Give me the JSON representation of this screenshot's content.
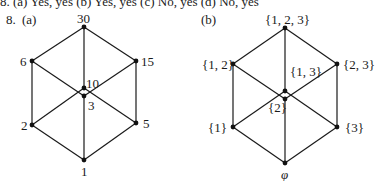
{
  "top_line": "8. (a)  Yes, yes    (b)  Yes, yes    (c)  No, yes    (d)  No, yes",
  "problem_number": "8.",
  "diagrams": [
    {
      "label": "(a)",
      "title": "Hasse diagram of divisors of 30",
      "nodes": [
        {
          "id": "30",
          "text": "30"
        },
        {
          "id": "6",
          "text": "6"
        },
        {
          "id": "15",
          "text": "15"
        },
        {
          "id": "10",
          "text": "10"
        },
        {
          "id": "3",
          "text": "3"
        },
        {
          "id": "2",
          "text": "2"
        },
        {
          "id": "5",
          "text": "5"
        },
        {
          "id": "1",
          "text": "1"
        }
      ],
      "edges": [
        [
          "30",
          "6"
        ],
        [
          "30",
          "15"
        ],
        [
          "30",
          "10"
        ],
        [
          "6",
          "2"
        ],
        [
          "6",
          "3"
        ],
        [
          "15",
          "3"
        ],
        [
          "15",
          "5"
        ],
        [
          "10",
          "2"
        ],
        [
          "10",
          "5"
        ],
        [
          "2",
          "1"
        ],
        [
          "3",
          "1"
        ],
        [
          "5",
          "1"
        ]
      ]
    },
    {
      "label": "(b)",
      "title": "Hasse diagram of power set of {1, 2, 3}",
      "nodes": [
        {
          "id": "123",
          "text": "{1, 2, 3}"
        },
        {
          "id": "12",
          "text": "{1, 2}"
        },
        {
          "id": "23",
          "text": "{2, 3}"
        },
        {
          "id": "13",
          "text": "{1, 3}"
        },
        {
          "id": "2",
          "text": "{2}"
        },
        {
          "id": "1",
          "text": "{1}"
        },
        {
          "id": "3",
          "text": "{3}"
        },
        {
          "id": "empty",
          "text": "φ"
        }
      ],
      "edges": [
        [
          "123",
          "12"
        ],
        [
          "123",
          "23"
        ],
        [
          "123",
          "13"
        ],
        [
          "12",
          "1"
        ],
        [
          "12",
          "2"
        ],
        [
          "23",
          "2"
        ],
        [
          "23",
          "3"
        ],
        [
          "13",
          "1"
        ],
        [
          "13",
          "3"
        ],
        [
          "1",
          "empty"
        ],
        [
          "2",
          "empty"
        ],
        [
          "3",
          "empty"
        ]
      ]
    }
  ],
  "colors": {
    "line": "#1a1a1a",
    "node": "#111111",
    "background": "#ffffff"
  }
}
